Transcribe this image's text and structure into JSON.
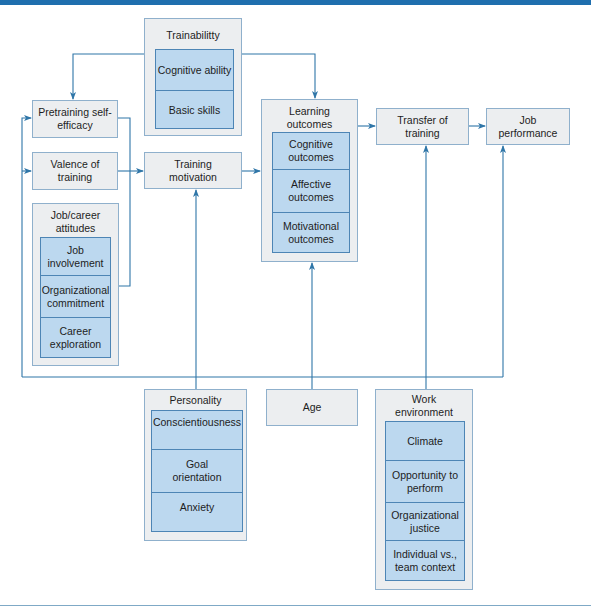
{
  "diagram": {
    "colors": {
      "line": "#2f76a8",
      "outer_box_fill": "#eceef0",
      "outer_box_border": "#8fb0cc",
      "inner_fill": "#bcd8ef",
      "inner_border": "#4d85b5",
      "top_bar": "#1f6fae"
    },
    "nodes": {
      "trainability": {
        "title": "Trainabilitty",
        "items": [
          "Cognitive ability",
          "Basic skills"
        ]
      },
      "pretraining": {
        "label": "Pretraining self-efficacy"
      },
      "valence": {
        "label": "Valence of training"
      },
      "job_career": {
        "title": "Job/career attitudes",
        "items": [
          "Job involvement",
          "Organizational commitment",
          "Career exploration"
        ]
      },
      "training_motivation": {
        "label": "Training motivation"
      },
      "learning_outcomes": {
        "title": "Learning outcomes",
        "items": [
          "Cognitive outcomes",
          "Affective outcomes",
          "Motivational outcomes"
        ]
      },
      "transfer": {
        "label": "Transfer of training"
      },
      "job_performance": {
        "label": "Job performance"
      },
      "personality": {
        "title": "Personality",
        "items": [
          "Conscientiousness",
          "Goal orientation",
          "Anxiety"
        ]
      },
      "age": {
        "label": "Age"
      },
      "work_environment": {
        "title": "Work environment",
        "items": [
          "Climate",
          "Opportunity to perform",
          "Organizational justice",
          "Individual vs., team context"
        ]
      }
    },
    "edges": [
      {
        "from": "Trainability",
        "to": "Pretraining self-efficacy"
      },
      {
        "from": "Trainability",
        "to": "Learning outcomes"
      },
      {
        "from": "Pretraining self-efficacy",
        "to": "Training motivation"
      },
      {
        "from": "Valence of training",
        "to": "Training motivation"
      },
      {
        "from": "Job/career attitudes",
        "to": "Training motivation"
      },
      {
        "from": "Training motivation",
        "to": "Learning outcomes"
      },
      {
        "from": "Learning outcomes",
        "to": "Transfer of training"
      },
      {
        "from": "Transfer of training",
        "to": "Job performance"
      },
      {
        "from": "Personality",
        "to": "Training motivation"
      },
      {
        "from": "Personality",
        "to": "Pretraining self-efficacy"
      },
      {
        "from": "Personality",
        "to": "Valence of training"
      },
      {
        "from": "Age",
        "to": "Learning outcomes"
      },
      {
        "from": "Work environment",
        "to": "Transfer of training"
      },
      {
        "from": "Work environment",
        "to": "Job performance"
      }
    ]
  }
}
